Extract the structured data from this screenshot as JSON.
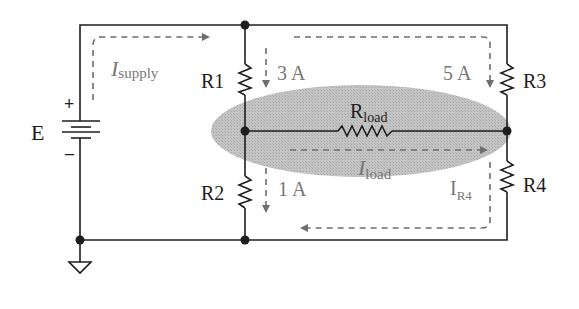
{
  "diagram": {
    "colors": {
      "wire": "#1e1e1e",
      "node": "#1e1e1e",
      "ellipse_fill": "#bdbdbd",
      "current_arrow": "#6e6e6e",
      "label_dark": "#1e1e1e",
      "label_gray": "#777777"
    },
    "source": {
      "label": "E",
      "plus": "+",
      "minus": "–"
    },
    "resistors": [
      {
        "id": "R1",
        "label": "R1"
      },
      {
        "id": "R2",
        "label": "R2"
      },
      {
        "id": "R3",
        "label": "R3"
      },
      {
        "id": "R4",
        "label": "R4"
      },
      {
        "id": "Rload",
        "label_main": "R",
        "label_sub": "load"
      }
    ],
    "currents": {
      "supply": {
        "main": "I",
        "sub": "supply"
      },
      "r1": {
        "value": "3 A"
      },
      "r2": {
        "value": "1 A"
      },
      "r3": {
        "value": "5 A"
      },
      "load": {
        "main": "I",
        "sub": "load"
      },
      "r4": {
        "main": "I",
        "sub": "R4"
      }
    },
    "ground": {
      "symbol": "ground-icon"
    }
  }
}
